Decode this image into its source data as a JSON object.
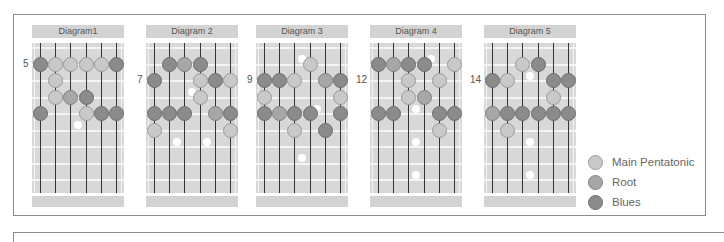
{
  "legend": {
    "items": [
      {
        "label": "Main Pentatonic",
        "type": "p",
        "color": "#c9c9c9"
      },
      {
        "label": "Root",
        "type": "r",
        "color": "#a7a7a7"
      },
      {
        "label": "Blues",
        "type": "b",
        "color": "#8b8b8b"
      }
    ]
  },
  "diagrams": [
    {
      "title": "Diagram1",
      "fret_label": "5",
      "fret_label_row": 1,
      "left": 32,
      "dots": [
        {
          "s": 0,
          "f": 1,
          "t": "b"
        },
        {
          "s": 1,
          "f": 1,
          "t": "p"
        },
        {
          "s": 2,
          "f": 1,
          "t": "p"
        },
        {
          "s": 3,
          "f": 1,
          "t": "p"
        },
        {
          "s": 4,
          "f": 1,
          "t": "p"
        },
        {
          "s": 5,
          "f": 1,
          "t": "b"
        },
        {
          "s": 1,
          "f": 2,
          "t": "p"
        },
        {
          "s": 1,
          "f": 3,
          "t": "p"
        },
        {
          "s": 2,
          "f": 3,
          "t": "r"
        },
        {
          "s": 3,
          "f": 3,
          "t": "b"
        },
        {
          "s": 0,
          "f": 4,
          "t": "b"
        },
        {
          "s": 3,
          "f": 4,
          "t": "p"
        },
        {
          "s": 4,
          "f": 4,
          "t": "b"
        },
        {
          "s": 5,
          "f": 4,
          "t": "b"
        }
      ],
      "markers": [
        {
          "x": 2.5,
          "f": 5
        }
      ]
    },
    {
      "title": "Diagram 2",
      "fret_label": "7",
      "fret_label_row": 2,
      "left": 146,
      "dots": [
        {
          "s": 1,
          "f": 1,
          "t": "b"
        },
        {
          "s": 2,
          "f": 1,
          "t": "r"
        },
        {
          "s": 3,
          "f": 1,
          "t": "b"
        },
        {
          "s": 0,
          "f": 2,
          "t": "b"
        },
        {
          "s": 3,
          "f": 2,
          "t": "p"
        },
        {
          "s": 4,
          "f": 2,
          "t": "b"
        },
        {
          "s": 5,
          "f": 2,
          "t": "p"
        },
        {
          "s": 3,
          "f": 3,
          "t": "p"
        },
        {
          "s": 0,
          "f": 4,
          "t": "b"
        },
        {
          "s": 1,
          "f": 4,
          "t": "b"
        },
        {
          "s": 2,
          "f": 4,
          "t": "b"
        },
        {
          "s": 4,
          "f": 4,
          "t": "r"
        },
        {
          "s": 5,
          "f": 4,
          "t": "b"
        },
        {
          "s": 0,
          "f": 5,
          "t": "p"
        },
        {
          "s": 5,
          "f": 5,
          "t": "p"
        }
      ],
      "markers": [
        {
          "x": 2.5,
          "f": 3
        },
        {
          "x": 1.5,
          "f": 6
        },
        {
          "x": 3.5,
          "f": 6
        }
      ]
    },
    {
      "title": "Diagram 3",
      "fret_label": "9",
      "fret_label_row": 2,
      "left": 256,
      "dots": [
        {
          "s": 3,
          "f": 1,
          "t": "p"
        },
        {
          "s": 0,
          "f": 2,
          "t": "b"
        },
        {
          "s": 1,
          "f": 2,
          "t": "b"
        },
        {
          "s": 2,
          "f": 2,
          "t": "p"
        },
        {
          "s": 4,
          "f": 2,
          "t": "r"
        },
        {
          "s": 5,
          "f": 2,
          "t": "b"
        },
        {
          "s": 0,
          "f": 3,
          "t": "p"
        },
        {
          "s": 5,
          "f": 3,
          "t": "p"
        },
        {
          "s": 0,
          "f": 4,
          "t": "b"
        },
        {
          "s": 1,
          "f": 4,
          "t": "r"
        },
        {
          "s": 2,
          "f": 4,
          "t": "b"
        },
        {
          "s": 3,
          "f": 4,
          "t": "b"
        },
        {
          "s": 5,
          "f": 4,
          "t": "b"
        },
        {
          "s": 2,
          "f": 5,
          "t": "p"
        },
        {
          "s": 4,
          "f": 5,
          "t": "b"
        }
      ],
      "markers": [
        {
          "x": 2.5,
          "f": 1
        },
        {
          "x": 3.5,
          "f": 4
        },
        {
          "x": 2.5,
          "f": 7
        }
      ]
    },
    {
      "title": "Diagram 4",
      "fret_label": "12",
      "fret_label_row": 2,
      "left": 370,
      "dots": [
        {
          "s": 0,
          "f": 1,
          "t": "b"
        },
        {
          "s": 1,
          "f": 1,
          "t": "r"
        },
        {
          "s": 2,
          "f": 1,
          "t": "b"
        },
        {
          "s": 3,
          "f": 1,
          "t": "b"
        },
        {
          "s": 5,
          "f": 1,
          "t": "p"
        },
        {
          "s": 2,
          "f": 2,
          "t": "p"
        },
        {
          "s": 4,
          "f": 2,
          "t": "p"
        },
        {
          "s": 2,
          "f": 3,
          "t": "p"
        },
        {
          "s": 3,
          "f": 3,
          "t": "r"
        },
        {
          "s": 0,
          "f": 4,
          "t": "b"
        },
        {
          "s": 1,
          "f": 4,
          "t": "b"
        },
        {
          "s": 4,
          "f": 4,
          "t": "b"
        },
        {
          "s": 5,
          "f": 4,
          "t": "b"
        },
        {
          "s": 4,
          "f": 5,
          "t": "p"
        }
      ],
      "markers": [
        {
          "x": 3.5,
          "f": 1
        },
        {
          "x": 2.5,
          "f": 4
        },
        {
          "x": 2.5,
          "f": 6
        },
        {
          "x": 2.5,
          "f": 8
        }
      ]
    },
    {
      "title": "Diagram 5",
      "fret_label": "14",
      "fret_label_row": 2,
      "left": 484,
      "dots": [
        {
          "s": 2,
          "f": 1,
          "t": "p"
        },
        {
          "s": 3,
          "f": 1,
          "t": "b"
        },
        {
          "s": 0,
          "f": 2,
          "t": "b"
        },
        {
          "s": 1,
          "f": 2,
          "t": "p"
        },
        {
          "s": 4,
          "f": 2,
          "t": "b"
        },
        {
          "s": 5,
          "f": 2,
          "t": "b"
        },
        {
          "s": 4,
          "f": 3,
          "t": "p"
        },
        {
          "s": 0,
          "f": 4,
          "t": "r"
        },
        {
          "s": 1,
          "f": 4,
          "t": "b"
        },
        {
          "s": 2,
          "f": 4,
          "t": "b"
        },
        {
          "s": 3,
          "f": 4,
          "t": "b"
        },
        {
          "s": 4,
          "f": 4,
          "t": "b"
        },
        {
          "s": 5,
          "f": 4,
          "t": "b"
        },
        {
          "s": 1,
          "f": 5,
          "t": "p"
        }
      ],
      "markers": [
        {
          "x": 2.5,
          "f": 2
        },
        {
          "x": 2.5,
          "f": 6
        },
        {
          "x": 2.5,
          "f": 8
        }
      ]
    }
  ]
}
